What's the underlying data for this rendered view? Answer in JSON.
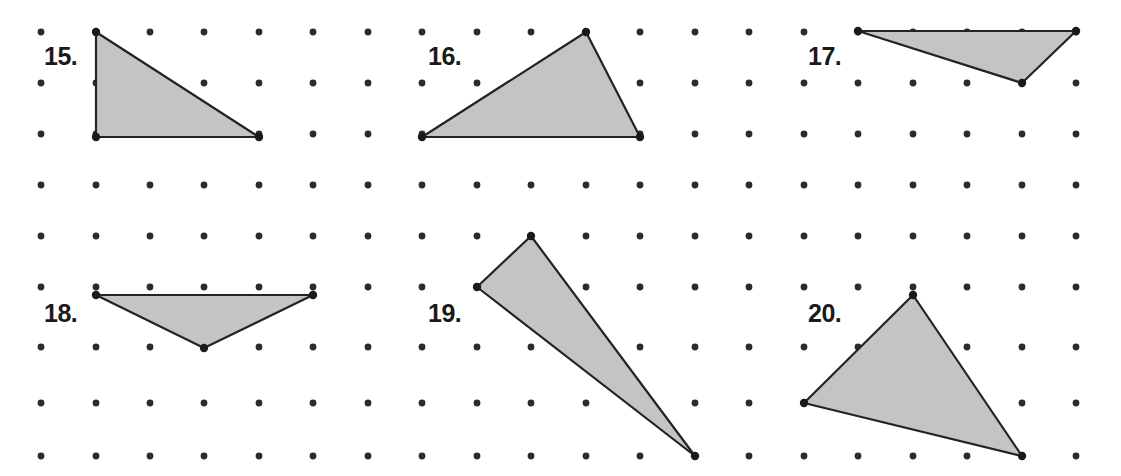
{
  "worksheet": {
    "width": 1121,
    "height": 476,
    "background_color": "#ffffff"
  },
  "grid": {
    "name": "geoboard-dot-grid",
    "dot_color": "#2b2b2b",
    "dot_radius": 3.4,
    "columns": 20,
    "rows": 9,
    "x_positions": [
      41,
      96,
      150,
      204,
      259,
      313,
      368,
      422,
      477,
      531,
      586,
      640,
      695,
      749,
      804,
      858,
      913,
      967,
      1022,
      1076
    ],
    "y_positions": [
      32,
      83,
      134,
      185,
      236,
      287,
      347,
      403,
      456
    ]
  },
  "shape_style": {
    "fill_color": "#c4c4c4",
    "stroke_color": "#232323",
    "stroke_width": 2.2,
    "vertex_dot_color": "#1a1a1a",
    "vertex_dot_radius": 4.2
  },
  "problems": [
    {
      "number": "15.",
      "label_x": 44,
      "label_y": 44,
      "shape": "triangle",
      "points": [
        [
          96,
          32
        ],
        [
          96,
          137
        ],
        [
          259,
          137
        ]
      ]
    },
    {
      "number": "16.",
      "label_x": 428,
      "label_y": 44,
      "shape": "triangle",
      "points": [
        [
          422,
          137
        ],
        [
          586,
          32
        ],
        [
          640,
          137
        ]
      ]
    },
    {
      "number": "17.",
      "label_x": 808,
      "label_y": 44,
      "shape": "triangle",
      "points": [
        [
          858,
          31
        ],
        [
          1076,
          31
        ],
        [
          1022,
          83
        ]
      ]
    },
    {
      "number": "18.",
      "label_x": 44,
      "label_y": 301,
      "shape": "triangle",
      "points": [
        [
          96,
          295
        ],
        [
          313,
          295
        ],
        [
          204,
          348
        ]
      ]
    },
    {
      "number": "19.",
      "label_x": 428,
      "label_y": 301,
      "shape": "triangle",
      "points": [
        [
          531,
          236
        ],
        [
          477,
          287
        ],
        [
          695,
          456
        ]
      ]
    },
    {
      "number": "20.",
      "label_x": 808,
      "label_y": 301,
      "shape": "triangle",
      "points": [
        [
          913,
          295
        ],
        [
          804,
          403
        ],
        [
          1022,
          456
        ]
      ]
    }
  ]
}
